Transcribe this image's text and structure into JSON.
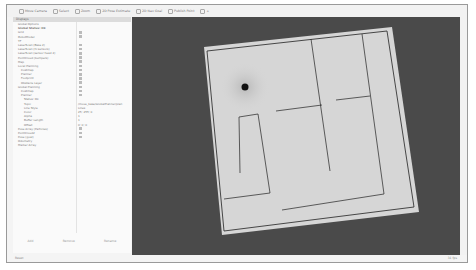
{
  "toolbar": {
    "tools": [
      {
        "label": "Move Camera",
        "icon": "move-camera-icon"
      },
      {
        "label": "Select",
        "icon": "select-icon"
      },
      {
        "label": "Zoom",
        "icon": "zoom-icon"
      },
      {
        "label": "2D Pose Estimate",
        "icon": "pose-estimate-icon"
      },
      {
        "label": "2D Nav Goal",
        "icon": "nav-goal-icon"
      },
      {
        "label": "Publish Point",
        "icon": "publish-point-icon"
      },
      {
        "label": "+",
        "icon": "add-tool-icon"
      }
    ]
  },
  "displays_panel": {
    "title": "Displays",
    "rows": [
      {
        "indent": 1,
        "label": "Global Options",
        "value": ""
      },
      {
        "indent": 1,
        "label": "Global Status: Ok",
        "value": "",
        "bold": true
      },
      {
        "indent": 1,
        "label": "Grid",
        "value": "",
        "checked": true
      },
      {
        "indent": 1,
        "label": "RobotModel",
        "value": "",
        "checked": true
      },
      {
        "indent": 1,
        "label": "TF",
        "value": "",
        "checked": false
      },
      {
        "indent": 1,
        "label": "LaserScan (Base 2)",
        "value": "",
        "checked": true
      },
      {
        "indent": 1,
        "label": "LaserScan (hi sensors)",
        "value": "",
        "checked": true
      },
      {
        "indent": 1,
        "label": "LaserScan (sensor head 2)",
        "value": "",
        "checked": true
      },
      {
        "indent": 1,
        "label": "PointCloud (bumpers)",
        "value": "",
        "checked": true
      },
      {
        "indent": 1,
        "label": "Map",
        "value": "",
        "checked": true
      },
      {
        "indent": 1,
        "label": "Local Planning",
        "value": "",
        "checked": true
      },
      {
        "indent": 2,
        "label": "Costmap",
        "value": "",
        "checked": true
      },
      {
        "indent": 2,
        "label": "Planner",
        "value": "",
        "checked": true
      },
      {
        "indent": 2,
        "label": "Footprint",
        "value": "",
        "checked": true
      },
      {
        "indent": 2,
        "label": "Obstacle Layer",
        "value": "",
        "checked": true
      },
      {
        "indent": 1,
        "label": "Global Planning",
        "value": "",
        "checked": true
      },
      {
        "indent": 2,
        "label": "Costmap",
        "value": "",
        "checked": true
      },
      {
        "indent": 2,
        "label": "Planner",
        "value": "",
        "checked": true
      },
      {
        "indent": 3,
        "label": "Status: Ok",
        "value": ""
      },
      {
        "indent": 3,
        "label": "Topic",
        "value": "/move_base/GlobalPlanner/plan"
      },
      {
        "indent": 3,
        "label": "Line Style",
        "value": "Lines"
      },
      {
        "indent": 3,
        "label": "Color",
        "value": "25; 255; 0"
      },
      {
        "indent": 3,
        "label": "Alpha",
        "value": "1"
      },
      {
        "indent": 3,
        "label": "Buffer Length",
        "value": "1"
      },
      {
        "indent": 3,
        "label": "Offset",
        "value": "0; 0; 0"
      },
      {
        "indent": 1,
        "label": "Pose Array (Particles)",
        "value": "",
        "checked": true
      },
      {
        "indent": 1,
        "label": "PointCloud2",
        "value": "",
        "checked": true
      },
      {
        "indent": 1,
        "label": "Pose (goal)",
        "value": "",
        "checked": true
      },
      {
        "indent": 1,
        "label": "Odometry",
        "value": "",
        "checked": false
      },
      {
        "indent": 1,
        "label": "Marker Array",
        "value": "",
        "checked": false
      }
    ],
    "buttons": [
      "Add",
      "Remove",
      "Rename"
    ]
  },
  "statusbar": {
    "text": "Reset",
    "fps": "31 fps"
  },
  "viewport": {
    "background": "#4a4a4a",
    "map_fill": "#d6d6d6",
    "wall_color": "#222222",
    "robot_color": "#111111"
  }
}
